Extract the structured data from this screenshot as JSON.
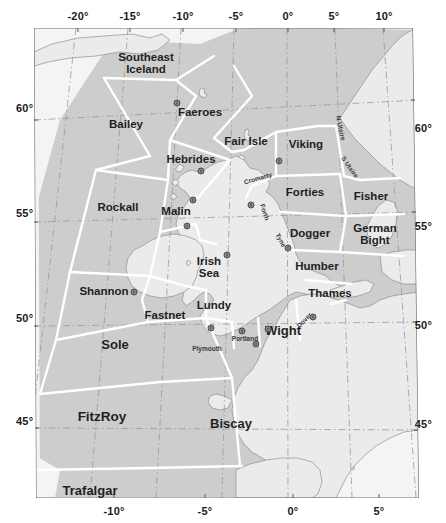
{
  "figure": {
    "kind": "map"
  },
  "axes": {
    "top_ticks": [
      {
        "label": "-20°",
        "x": 78
      },
      {
        "label": "-15°",
        "x": 130
      },
      {
        "label": "-10°",
        "x": 183
      },
      {
        "label": "-5°",
        "x": 236
      },
      {
        "label": "0°",
        "x": 288
      },
      {
        "label": "5°",
        "x": 334
      },
      {
        "label": "10°",
        "x": 384
      }
    ],
    "bottom_ticks": [
      {
        "label": "-10°",
        "x": 114
      },
      {
        "label": "-5°",
        "x": 205
      },
      {
        "label": "0°",
        "x": 293
      },
      {
        "label": "5°",
        "x": 379
      }
    ],
    "left_ticks": [
      {
        "label": "60°",
        "y": 108
      },
      {
        "label": "55°",
        "y": 213
      },
      {
        "label": "50°",
        "y": 318
      },
      {
        "label": "45°",
        "y": 421
      }
    ],
    "right_ticks": [
      {
        "label": "60°",
        "y": 128
      },
      {
        "label": "55°",
        "y": 226
      },
      {
        "label": "50°",
        "y": 325
      },
      {
        "label": "45°",
        "y": 424
      }
    ]
  },
  "colors": {
    "sea_outside": "#f4f4f4",
    "forecast_area_fill": "#cdcdcd",
    "land_fill": "#e9e9e9",
    "area_boundary": "#ffffff",
    "graticule": "#9a9a9a",
    "coastline": "#8c8c8c",
    "frame": "#6f6f6f",
    "label_text": "#1f1f1f"
  },
  "forecast_areas": [
    {
      "name": "Southeast\nIceland",
      "x": 146,
      "y": 63
    },
    {
      "name": "Faeroes",
      "x": 200,
      "y": 112
    },
    {
      "name": "Bailey",
      "x": 126,
      "y": 124
    },
    {
      "name": "Fair Isle",
      "x": 246,
      "y": 141
    },
    {
      "name": "Viking",
      "x": 306,
      "y": 144
    },
    {
      "name": "Hebrides",
      "x": 191,
      "y": 159
    },
    {
      "name": "Rockall",
      "x": 118,
      "y": 207
    },
    {
      "name": "Forties",
      "x": 305,
      "y": 192
    },
    {
      "name": "Fisher",
      "x": 371,
      "y": 196
    },
    {
      "name": "Malin",
      "x": 176,
      "y": 211
    },
    {
      "name": "Dogger",
      "x": 310,
      "y": 233
    },
    {
      "name": "German\nBight",
      "x": 375,
      "y": 234
    },
    {
      "name": "Irish\nSea",
      "x": 209,
      "y": 267
    },
    {
      "name": "Humber",
      "x": 317,
      "y": 266
    },
    {
      "name": "Shannon",
      "x": 104,
      "y": 291
    },
    {
      "name": "Lundy",
      "x": 214,
      "y": 305
    },
    {
      "name": "Thames",
      "x": 330,
      "y": 293
    },
    {
      "name": "Fastnet",
      "x": 165,
      "y": 315
    },
    {
      "name": "Wight",
      "x": 283,
      "y": 331
    },
    {
      "name": "Sole",
      "x": 115,
      "y": 345
    },
    {
      "name": "FitzRoy",
      "x": 102,
      "y": 417
    },
    {
      "name": "Biscay",
      "x": 231,
      "y": 424
    },
    {
      "name": "Trafalgar",
      "x": 90,
      "y": 491
    }
  ],
  "coastal_labels": [
    {
      "name": "Cromarty",
      "x": 258,
      "y": 178,
      "rotate": -16
    },
    {
      "name": "Forth",
      "x": 265,
      "y": 212,
      "rotate": 72
    },
    {
      "name": "Tyne",
      "x": 281,
      "y": 240,
      "rotate": 62
    },
    {
      "name": "N Utsire",
      "x": 341,
      "y": 128,
      "rotate": 78
    },
    {
      "name": "S Utsire",
      "x": 350,
      "y": 167,
      "rotate": 55
    },
    {
      "name": "Plymouth",
      "x": 207,
      "y": 348,
      "rotate": 0
    },
    {
      "name": "Portland",
      "x": 245,
      "y": 338,
      "rotate": 0
    },
    {
      "name": "Dover",
      "x": 304,
      "y": 320,
      "rotate": -46
    }
  ],
  "stations": [
    {
      "x": 201,
      "y": 171
    },
    {
      "x": 193,
      "y": 200
    },
    {
      "x": 187,
      "y": 226
    },
    {
      "x": 279,
      "y": 161
    },
    {
      "x": 251,
      "y": 205
    },
    {
      "x": 288,
      "y": 248
    },
    {
      "x": 227,
      "y": 255
    },
    {
      "x": 134,
      "y": 292
    },
    {
      "x": 211,
      "y": 328
    },
    {
      "x": 242,
      "y": 331
    },
    {
      "x": 256,
      "y": 344
    },
    {
      "x": 268,
      "y": 329
    },
    {
      "x": 313,
      "y": 317
    },
    {
      "x": 177,
      "y": 103
    }
  ]
}
